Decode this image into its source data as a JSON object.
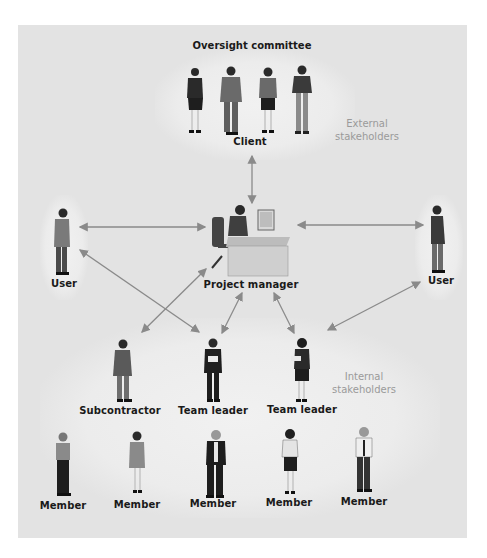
{
  "diagram": {
    "title": "Oversight committee",
    "groups": {
      "external_label_line1": "External",
      "external_label_line2": "stakeholders",
      "internal_label_line1": "Internal",
      "internal_label_line2": "stakeholders"
    },
    "nodes": {
      "client": "Client",
      "project_manager": "Project manager",
      "user_left": "User",
      "user_right": "User",
      "subcontractor": "Subcontractor",
      "team_leader_1": "Team leader",
      "team_leader_2": "Team leader",
      "members": [
        "Member",
        "Member",
        "Member",
        "Member",
        "Member"
      ]
    },
    "connections": [
      {
        "from": "Client",
        "to": "Project manager",
        "type": "bidirectional"
      },
      {
        "from": "User (left)",
        "to": "Project manager",
        "type": "bidirectional"
      },
      {
        "from": "User (right)",
        "to": "Project manager",
        "type": "bidirectional"
      },
      {
        "from": "User (left)",
        "to": "Team leader (1)",
        "type": "bidirectional"
      },
      {
        "from": "Project manager",
        "to": "Subcontractor",
        "type": "bidirectional"
      },
      {
        "from": "Project manager",
        "to": "Team leader (1)",
        "type": "bidirectional"
      },
      {
        "from": "Project manager",
        "to": "Team leader (2)",
        "type": "bidirectional"
      },
      {
        "from": "User (right)",
        "to": "Team leader (2)",
        "type": "bidirectional"
      }
    ],
    "colors": {
      "background": "#e3e3e3",
      "arrow": "#8a8a8a",
      "label": "#1a1a1a",
      "group_label": "#9a9a9a"
    }
  }
}
